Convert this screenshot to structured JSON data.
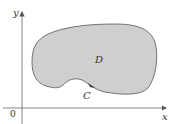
{
  "diagram": {
    "type": "region-with-boundary-curve",
    "axes": {
      "x_label": "x",
      "y_label": "y",
      "origin_label": "0"
    },
    "region": {
      "label": "D",
      "fill": "#cfcfcf",
      "stroke": "#555555"
    },
    "curve": {
      "label": "C",
      "orientation": "counterclockwise"
    },
    "colors": {
      "axis": "#666666",
      "text": "#333333"
    }
  }
}
